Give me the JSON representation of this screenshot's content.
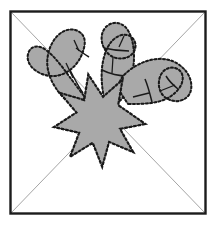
{
  "figure": {
    "title": "Burst with three radiating hook shapes inside diagonally divided square",
    "type": "line-art-diagram",
    "canvas": {
      "width": 216,
      "height": 225
    },
    "colors": {
      "background": "#ffffff",
      "frame_stroke": "#1c1c1c",
      "diagonal_stroke": "#9a9a9a",
      "shape_fill": "#a9a9a9",
      "shape_fill_light": "#b8b8b8",
      "shape_stroke": "#1a1a1a",
      "detail_stroke": "#1a1a1a"
    },
    "frame": {
      "name": "square-border",
      "x": 10,
      "y": 11,
      "width": 196,
      "height": 203,
      "stroke_width": 2.4
    },
    "diagonals": [
      {
        "name": "diagonal-top-left-to-bottom-right",
        "x1": 11,
        "y1": 12,
        "x2": 205,
        "y2": 213
      },
      {
        "name": "diagonal-top-right-to-bottom-left",
        "x1": 205,
        "y1": 12,
        "x2": 11,
        "y2": 213
      }
    ],
    "burst": {
      "name": "eight-point-star",
      "center_x": 106,
      "center_y": 117,
      "points": 8,
      "outer_radius": 40,
      "inner_radius": 19,
      "rotation_deg": 10
    },
    "hooks": [
      {
        "name": "hook-upper-left",
        "label": "left radiating hook",
        "direction_deg": 215,
        "segments": 3
      },
      {
        "name": "hook-upper-middle",
        "label": "center radiating hook",
        "direction_deg": 275,
        "segments": 3
      },
      {
        "name": "hook-right",
        "label": "right radiating hook",
        "direction_deg": 340,
        "segments": 3
      }
    ]
  }
}
